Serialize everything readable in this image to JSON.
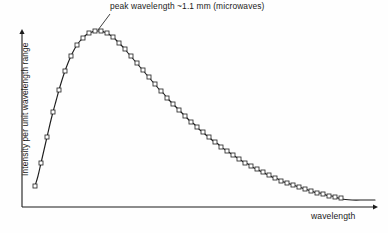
{
  "figure": {
    "background_color": "#fefefe",
    "ink_color": "#1b1b1b",
    "width": 388,
    "height": 233
  },
  "axes": {
    "x_label": "wavelength",
    "y_label": "Intensity per unit wavelength range",
    "origin": [
      22,
      207
    ],
    "y_axis_top": [
      22,
      29
    ],
    "x_axis_right": [
      378,
      207
    ],
    "ticks_shown": false,
    "tick_labels_shown": false,
    "grid": false
  },
  "annotations": [
    {
      "name": "peak-annotation",
      "text": "peak wavelength ~1.1 mm (microwaves)",
      "text_x": 110,
      "text_y": 2,
      "leader_from": [
        110,
        14
      ],
      "leader_to": [
        98,
        30
      ]
    }
  ],
  "chart_data": {
    "type": "line",
    "title": "",
    "subtitle": "",
    "xlabel": "wavelength",
    "ylabel": "Intensity per unit wavelength range",
    "legend_position": "none",
    "grid": false,
    "axis_ticks": false,
    "xlim": [
      0,
      1
    ],
    "ylim": [
      0,
      1
    ],
    "marker": "open-square",
    "marker_size_px": 4,
    "annotation": "peak wavelength ~1.1 mm (microwaves)",
    "peak_wavelength_mm": 1.1,
    "peak_band": "microwaves",
    "series": [
      {
        "name": "blackbody spectrum",
        "points_px": [
          [
            35,
            186
          ],
          [
            38,
            176
          ],
          [
            41,
            163
          ],
          [
            44,
            150
          ],
          [
            47,
            137
          ],
          [
            50,
            124
          ],
          [
            53,
            112
          ],
          [
            56,
            101
          ],
          [
            59,
            90
          ],
          [
            62,
            80
          ],
          [
            65,
            71
          ],
          [
            68,
            63
          ],
          [
            71,
            56
          ],
          [
            74,
            50
          ],
          [
            77,
            45
          ],
          [
            80,
            41
          ],
          [
            83,
            38
          ],
          [
            86,
            35
          ],
          [
            89,
            33
          ],
          [
            92,
            32
          ],
          [
            95,
            31
          ],
          [
            98,
            31
          ],
          [
            101,
            31
          ],
          [
            104,
            32
          ],
          [
            107,
            33
          ],
          [
            110,
            35
          ],
          [
            113,
            37
          ],
          [
            116,
            40
          ],
          [
            119,
            43
          ],
          [
            122,
            46
          ],
          [
            125,
            49
          ],
          [
            128,
            53
          ],
          [
            131,
            56
          ],
          [
            134,
            60
          ],
          [
            137,
            63
          ],
          [
            140,
            67
          ],
          [
            143,
            70
          ],
          [
            146,
            74
          ],
          [
            149,
            77
          ],
          [
            152,
            81
          ],
          [
            155,
            84
          ],
          [
            158,
            88
          ],
          [
            161,
            91
          ],
          [
            164,
            94
          ],
          [
            167,
            98
          ],
          [
            170,
            101
          ],
          [
            173,
            104
          ],
          [
            176,
            107
          ],
          [
            179,
            110
          ],
          [
            182,
            113
          ],
          [
            185,
            116
          ],
          [
            188,
            119
          ],
          [
            191,
            122
          ],
          [
            194,
            124
          ],
          [
            197,
            127
          ],
          [
            200,
            130
          ],
          [
            203,
            132
          ],
          [
            206,
            135
          ],
          [
            209,
            137
          ],
          [
            212,
            140
          ],
          [
            215,
            142
          ],
          [
            218,
            144
          ],
          [
            221,
            147
          ],
          [
            224,
            149
          ],
          [
            227,
            151
          ],
          [
            230,
            153
          ],
          [
            233,
            155
          ],
          [
            236,
            157
          ],
          [
            239,
            159
          ],
          [
            242,
            161
          ],
          [
            245,
            163
          ],
          [
            248,
            164
          ],
          [
            251,
            166
          ],
          [
            254,
            168
          ],
          [
            257,
            169
          ],
          [
            260,
            171
          ],
          [
            263,
            172
          ],
          [
            266,
            174
          ],
          [
            269,
            175
          ],
          [
            272,
            177
          ],
          [
            275,
            178
          ],
          [
            278,
            179
          ],
          [
            281,
            181
          ],
          [
            284,
            182
          ],
          [
            287,
            183
          ],
          [
            290,
            184
          ],
          [
            293,
            185
          ],
          [
            296,
            186
          ],
          [
            299,
            187
          ],
          [
            302,
            188
          ],
          [
            305,
            189
          ],
          [
            308,
            190
          ],
          [
            311,
            191
          ],
          [
            314,
            192
          ],
          [
            317,
            193
          ],
          [
            320,
            193
          ],
          [
            323,
            194
          ],
          [
            326,
            195
          ],
          [
            329,
            196
          ],
          [
            332,
            196
          ],
          [
            335,
            197
          ],
          [
            338,
            198
          ],
          [
            341,
            198
          ]
        ],
        "tail_px": [
          [
            341,
            199
          ],
          [
            352,
            200
          ],
          [
            364,
            200
          ],
          [
            375,
            200
          ]
        ]
      }
    ]
  }
}
